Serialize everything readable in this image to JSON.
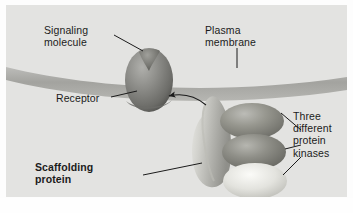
{
  "figure": {
    "panel_background": "#e3e3e1",
    "outer_background": "#fdfdfd"
  },
  "labels": {
    "signaling_molecule": "Signaling\nmolecule",
    "plasma_membrane": "Plasma\nmembrane",
    "receptor": "Receptor",
    "protein_kinases": "Three\ndifferent\nprotein\nkinases",
    "scaffolding_protein": "Scaffolding\nprotein"
  },
  "structures": {
    "membrane": {
      "name": "plasma-membrane",
      "color": "#a9a9a6",
      "description": "horizontal gray band curving gently downward across the panel"
    },
    "receptor": {
      "name": "receptor",
      "color_dark": "#6f6f6c",
      "color_light": "#9d9d99",
      "description": "egg-shaped transmembrane protein with a notch at the top"
    },
    "signaling_molecule": {
      "name": "signaling-molecule",
      "color": "#74746f",
      "description": "small dark wedge seated in the notch of the receptor"
    },
    "scaffolding_protein": {
      "name": "scaffolding-protein",
      "color_light": "#c9c9c4",
      "color_mid": "#a5a5a0",
      "description": "elongated curved blob in the cytoplasm holding the kinases"
    },
    "kinases": [
      {
        "name": "protein-kinase-top",
        "fill": "#8e8e8a",
        "highlight": "#b4b4af"
      },
      {
        "name": "protein-kinase-middle",
        "fill": "#868682",
        "highlight": "#aeaea9"
      },
      {
        "name": "protein-kinase-bottom",
        "fill": "#dededa",
        "highlight": "#f2f2ef"
      }
    ],
    "recruitment_arrow": {
      "name": "recruitment-arrow",
      "color": "#1b1b1b",
      "description": "curved arrow from the scaffolding complex pointing left to the receptor"
    }
  },
  "leader_lines": {
    "color": "#1b1b1b",
    "items": [
      "signaling-molecule-leader",
      "plasma-membrane-leader",
      "receptor-leader",
      "scaffolding-protein-leader",
      "kinase-leader-top",
      "kinase-leader-middle",
      "kinase-leader-bottom"
    ]
  }
}
